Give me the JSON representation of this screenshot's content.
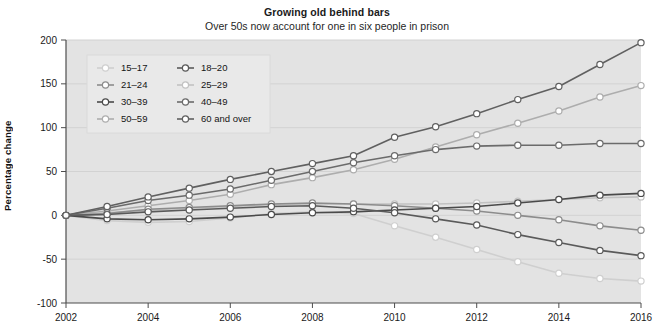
{
  "chart_data": {
    "type": "line",
    "title": "Growing old behind bars",
    "subtitle": "Over 50s now account for one in six people in prison",
    "xlabel": "",
    "ylabel": "Percentage change",
    "x": [
      2002,
      2003,
      2004,
      2005,
      2006,
      2007,
      2008,
      2009,
      2010,
      2011,
      2012,
      2013,
      2014,
      2015,
      2016
    ],
    "xlim": [
      2002,
      2016
    ],
    "xticks": [
      2002,
      2004,
      2006,
      2008,
      2010,
      2012,
      2014,
      2016
    ],
    "xticklabels": [
      "2002",
      "2004",
      "2006",
      "2008",
      "2010",
      "2012",
      "2014",
      "2016"
    ],
    "ylim": [
      -100,
      200
    ],
    "yticks": [
      -100,
      -50,
      0,
      50,
      100,
      150,
      200
    ],
    "yticklabels": [
      "-100",
      "-50",
      "0",
      "50",
      "100",
      "150",
      "200"
    ],
    "grid": true,
    "legend_position": "upper-left",
    "series": [
      {
        "name": "15-17",
        "color": "#cfcfcf",
        "values": [
          0,
          -6,
          -8,
          -7,
          -3,
          2,
          4,
          2,
          -12,
          -25,
          -39,
          -53,
          -66,
          -72,
          -75
        ]
      },
      {
        "name": "18-20",
        "color": "#5a5a5a",
        "values": [
          0,
          1,
          4,
          6,
          8,
          10,
          11,
          8,
          3,
          -4,
          -11,
          -22,
          -31,
          -40,
          -46
        ]
      },
      {
        "name": "21-24",
        "color": "#8c8c8c",
        "values": [
          0,
          2,
          7,
          9,
          11,
          13,
          14,
          13,
          11,
          8,
          5,
          0,
          -5,
          -12,
          -17
        ]
      },
      {
        "name": "25-29",
        "color": "#c2c2c2",
        "values": [
          0,
          3,
          6,
          8,
          10,
          12,
          13,
          13,
          13,
          13,
          14,
          16,
          18,
          20,
          21
        ]
      },
      {
        "name": "30-39",
        "color": "#4a4a4a",
        "values": [
          0,
          -4,
          -5,
          -4,
          -2,
          1,
          3,
          4,
          6,
          8,
          10,
          14,
          18,
          23,
          25
        ]
      },
      {
        "name": "40-49",
        "color": "#6b6b6b",
        "values": [
          0,
          8,
          17,
          23,
          30,
          40,
          50,
          60,
          68,
          75,
          79,
          80,
          80,
          82,
          82
        ]
      },
      {
        "name": "50-59",
        "color": "#adadad",
        "values": [
          0,
          5,
          11,
          17,
          24,
          35,
          43,
          52,
          64,
          78,
          92,
          105,
          119,
          135,
          148
        ]
      },
      {
        "name": "60 and over",
        "color": "#606060",
        "values": [
          0,
          10,
          21,
          31,
          41,
          50,
          59,
          68,
          89,
          101,
          116,
          132,
          147,
          172,
          197
        ]
      }
    ]
  },
  "legend": {
    "entries": [
      {
        "label": "15-17"
      },
      {
        "label": "18-20"
      },
      {
        "label": "21-24"
      },
      {
        "label": "25-29"
      },
      {
        "label": "30-39"
      },
      {
        "label": "40-49"
      },
      {
        "label": "50-59"
      },
      {
        "label": "60 and over"
      }
    ]
  },
  "style": {
    "plot_background": "#e3e3e3",
    "grid_color": "#d2d2d2",
    "axis_color": "#4d4d4d",
    "marker_fill": "#ffffff",
    "page_background": "#ffffff"
  }
}
